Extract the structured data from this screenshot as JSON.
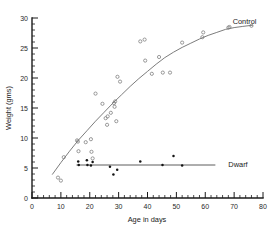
{
  "chart_data": {
    "type": "scatter",
    "title": "",
    "xlabel": "Age in days",
    "ylabel": "Weight (gms)",
    "xlim": [
      0,
      80
    ],
    "ylim": [
      0,
      30
    ],
    "xticks": [
      0,
      10,
      20,
      30,
      40,
      50,
      60,
      70,
      80
    ],
    "xticklabels": [
      "0",
      "10",
      "20",
      "30",
      "40",
      "50",
      "60",
      "70",
      "80"
    ],
    "yticks": [
      0,
      5,
      10,
      15,
      20,
      25,
      30
    ],
    "yticklabels": [
      "0",
      "5",
      "10",
      "15",
      "20",
      "25",
      "30"
    ],
    "x_minor_step": 2,
    "y_minor_step": 1,
    "grid": false,
    "legend_position": "inline-right",
    "series": [
      {
        "name": "Control",
        "label": "Control",
        "marker": "open-circle",
        "color": "#7a7a7a",
        "label_x": 69.5,
        "label_y": 29.4,
        "points": [
          [
            9.0,
            3.4
          ],
          [
            10.0,
            2.9
          ],
          [
            11.0,
            6.8
          ],
          [
            15.6,
            9.6
          ],
          [
            15.9,
            9.4
          ],
          [
            16.1,
            7.8
          ],
          [
            18.6,
            9.3
          ],
          [
            20.4,
            9.8
          ],
          [
            20.6,
            7.7
          ],
          [
            21.0,
            6.6
          ],
          [
            22.0,
            17.4
          ],
          [
            24.4,
            15.7
          ],
          [
            25.5,
            13.3
          ],
          [
            26.2,
            13.6
          ],
          [
            26.0,
            12.2
          ],
          [
            27.3,
            14.2
          ],
          [
            28.4,
            15.8
          ],
          [
            28.8,
            16.1
          ],
          [
            28.6,
            15.2
          ],
          [
            29.2,
            12.8
          ],
          [
            29.6,
            20.2
          ],
          [
            30.5,
            19.4
          ],
          [
            37.5,
            26.1
          ],
          [
            39.0,
            26.4
          ],
          [
            39.2,
            22.9
          ],
          [
            41.5,
            20.7
          ],
          [
            44.0,
            23.5
          ],
          [
            45.3,
            20.9
          ],
          [
            47.8,
            20.9
          ],
          [
            52.0,
            25.9
          ],
          [
            59.0,
            26.8
          ],
          [
            59.3,
            27.6
          ],
          [
            68.0,
            28.4
          ],
          [
            68.4,
            28.5
          ],
          [
            76.0,
            28.7
          ]
        ],
        "fit_curve": [
          [
            7.0,
            3.9
          ],
          [
            10.0,
            5.9
          ],
          [
            13.0,
            7.8
          ],
          [
            16.0,
            9.6
          ],
          [
            19.0,
            11.2
          ],
          [
            22.0,
            12.8
          ],
          [
            25.0,
            14.3
          ],
          [
            28.0,
            15.8
          ],
          [
            31.0,
            17.2
          ],
          [
            34.0,
            18.6
          ],
          [
            37.0,
            19.9
          ],
          [
            40.0,
            21.1
          ],
          [
            43.0,
            22.3
          ],
          [
            46.0,
            23.4
          ],
          [
            49.0,
            24.3
          ],
          [
            52.0,
            25.1
          ],
          [
            55.0,
            25.8
          ],
          [
            58.0,
            26.5
          ],
          [
            61.0,
            27.1
          ],
          [
            64.0,
            27.6
          ],
          [
            67.0,
            28.1
          ],
          [
            70.0,
            28.4
          ],
          [
            73.0,
            28.6
          ],
          [
            76.5,
            28.8
          ]
        ]
      },
      {
        "name": "Dwarf",
        "label": "Dwarf",
        "marker": "filled-circle",
        "color": "#141414",
        "label_x": 68.0,
        "label_y": 5.6,
        "points": [
          [
            16.0,
            6.1
          ],
          [
            16.2,
            5.5
          ],
          [
            19.0,
            6.3
          ],
          [
            19.2,
            5.5
          ],
          [
            20.4,
            5.4
          ],
          [
            21.0,
            6.0
          ],
          [
            27.0,
            5.2
          ],
          [
            28.2,
            3.9
          ],
          [
            29.5,
            4.7
          ],
          [
            37.5,
            6.1
          ],
          [
            45.2,
            5.5
          ],
          [
            49.0,
            7.0
          ],
          [
            52.0,
            5.4
          ]
        ],
        "fit_line": [
          [
            15.4,
            5.5
          ],
          [
            63.5,
            5.5
          ]
        ]
      }
    ]
  }
}
